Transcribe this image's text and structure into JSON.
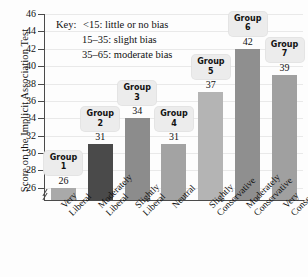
{
  "chart_data": {
    "type": "bar",
    "title": "",
    "xlabel": "",
    "ylabel": "Score on the Implicit Association Test",
    "ylim": [
      24.6,
      46
    ],
    "ytick_values": [
      26,
      28,
      30,
      32,
      34,
      36,
      38,
      40,
      42,
      44,
      46
    ],
    "ytick_labels": [
      "26",
      "28",
      "30",
      "32",
      "34",
      "36",
      "38",
      "40",
      "42",
      "44",
      "46"
    ],
    "grid": true,
    "axis_break": true,
    "legend_position": "inside-top-left",
    "categories": [
      "Very Liberal",
      "Moderately Liberal",
      "Slightly Liberal",
      "Neutral",
      "Slightly Conservative",
      "Moderately Conservative",
      "Very Conservative"
    ],
    "category_lines": [
      [
        "Very",
        "Liberal"
      ],
      [
        "Moderately",
        "Liberal"
      ],
      [
        "Slightly",
        "Liberal"
      ],
      [
        "Neutral",
        ""
      ],
      [
        "Slightly",
        "Conservative"
      ],
      [
        "Moderately",
        "Conservative"
      ],
      [
        "Very",
        "Conservative"
      ]
    ],
    "values": [
      26,
      31,
      34,
      31,
      37,
      42,
      39
    ],
    "value_labels": [
      "26",
      "31",
      "34",
      "31",
      "37",
      "42",
      "39"
    ],
    "group_labels": [
      "Group 1",
      "Group 2",
      "Group 3",
      "Group 4",
      "Group 5",
      "Group 6",
      "Group 7"
    ],
    "group_label_lines": [
      [
        "Group",
        "1"
      ],
      [
        "Group",
        "2"
      ],
      [
        "Group",
        "3"
      ],
      [
        "Group",
        "4"
      ],
      [
        "Group",
        "5"
      ],
      [
        "Group",
        "6"
      ],
      [
        "Group",
        "7"
      ]
    ],
    "bar_colors": [
      "#a9a9a9",
      "#4a4a4a",
      "#8c8c8c",
      "#a3a3a3",
      "#b4b4b4",
      "#8f8f8f",
      "#a0a0a0"
    ]
  },
  "key": {
    "title": "Key:",
    "rows": [
      "<15: little or no bias",
      "15–35: slight bias",
      "35–65: moderate bias"
    ]
  },
  "colors": {
    "axis": "#4a4a4a",
    "grid": "#e9e9e9",
    "text": "#111111",
    "callout_bg": "#ececec"
  }
}
